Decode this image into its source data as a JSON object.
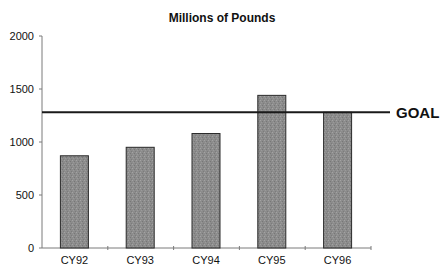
{
  "chart_data": {
    "type": "bar",
    "title": "Millions of Pounds",
    "xlabel": "",
    "ylabel": "",
    "categories": [
      "CY92",
      "CY93",
      "CY94",
      "CY95",
      "CY96"
    ],
    "values": [
      870,
      950,
      1080,
      1440,
      1280
    ],
    "ylim": [
      0,
      2000
    ],
    "yticks": [
      0,
      500,
      1000,
      1500,
      2000
    ],
    "ytick_labels": [
      "0",
      "500",
      "1000",
      "1500",
      "2000"
    ],
    "grid": false,
    "legend": null,
    "reference_lines": [
      {
        "label": "GOAL",
        "value": 1280,
        "orientation": "horizontal"
      }
    ],
    "colors": {
      "bar_fill": "#8c8c8c",
      "bar_border": "#2a2a2a",
      "axis": "#7a7a7a",
      "goal_line": "#1a1a1a",
      "text": "#111111"
    }
  }
}
